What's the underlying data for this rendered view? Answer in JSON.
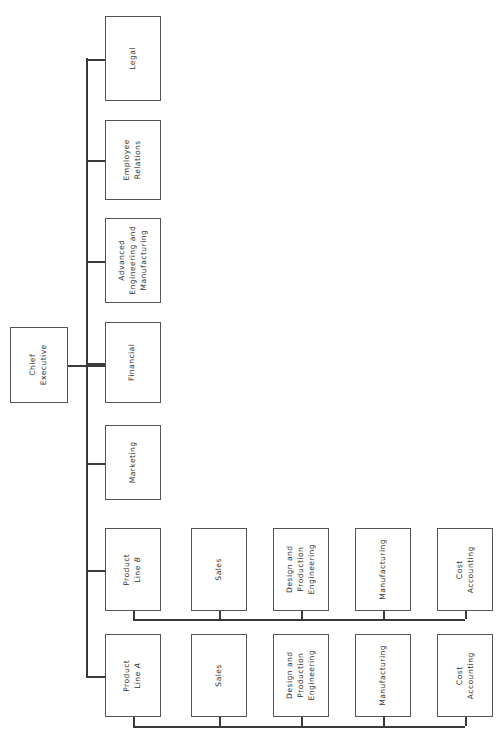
{
  "diagram": {
    "type": "org-chart",
    "orientation": "rotated-90-text",
    "background_color": "#ffffff",
    "line_color": "#3a3a3a",
    "box_border_color": "#555555",
    "text_color": "#333333"
  },
  "root": {
    "label": "Chief\nExecutive",
    "x": 10,
    "y": 327,
    "w": 58,
    "h": 76
  },
  "staff": [
    {
      "label": "Legal",
      "x": 105,
      "y": 16,
      "w": 56,
      "h": 85
    },
    {
      "label": "Employee\nRelations",
      "x": 105,
      "y": 120,
      "w": 56,
      "h": 80
    },
    {
      "label": "Advanced\nEngineering and\nManufacturing",
      "x": 105,
      "y": 218,
      "w": 56,
      "h": 85
    },
    {
      "label": "Financial",
      "x": 105,
      "y": 322,
      "w": 56,
      "h": 81
    },
    {
      "label": "Marketing",
      "x": 105,
      "y": 425,
      "w": 56,
      "h": 75
    }
  ],
  "product_lines": [
    {
      "label": "Product\nLine B",
      "x": 105,
      "y": 528,
      "w": 56,
      "h": 83,
      "children": [
        {
          "label": "Sales",
          "x": 191,
          "y": 528,
          "w": 56,
          "h": 83
        },
        {
          "label": "Design and\nProduction\nEngineering",
          "x": 273,
          "y": 528,
          "w": 56,
          "h": 83
        },
        {
          "label": "Manufacturing",
          "x": 355,
          "y": 528,
          "w": 56,
          "h": 83
        },
        {
          "label": "Cost\nAccounting",
          "x": 437,
          "y": 528,
          "w": 56,
          "h": 83
        }
      ],
      "bus_y": 619
    },
    {
      "label": "Product\nLine A",
      "x": 105,
      "y": 634,
      "w": 56,
      "h": 83,
      "children": [
        {
          "label": "Sales",
          "x": 191,
          "y": 634,
          "w": 56,
          "h": 83
        },
        {
          "label": "Design and\nProduction\nEngineering",
          "x": 273,
          "y": 634,
          "w": 56,
          "h": 83
        },
        {
          "label": "Manufacturing",
          "x": 355,
          "y": 634,
          "w": 56,
          "h": 83
        },
        {
          "label": "Cost\nAccounting",
          "x": 437,
          "y": 634,
          "w": 56,
          "h": 83
        }
      ],
      "bus_y": 726
    }
  ],
  "trunk": {
    "x": 86,
    "top": 58,
    "bottom": 676
  },
  "root_stub": {
    "y": 365,
    "from_x": 68,
    "to_x": 105
  },
  "branch_stubs": [
    {
      "y": 58,
      "from_x": 86,
      "to_x": 105
    },
    {
      "y": 160,
      "from_x": 86,
      "to_x": 105
    },
    {
      "y": 260,
      "from_x": 86,
      "to_x": 105
    },
    {
      "y": 365,
      "from_x": 86,
      "to_x": 105
    },
    {
      "y": 462,
      "from_x": 86,
      "to_x": 105
    },
    {
      "y": 570,
      "from_x": 86,
      "to_x": 105
    },
    {
      "y": 676,
      "from_x": 86,
      "to_x": 105
    }
  ]
}
